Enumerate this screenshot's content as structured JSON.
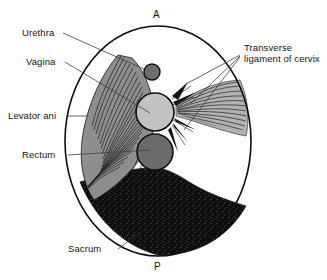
{
  "figure": {
    "orientation": {
      "anterior_marker": "A",
      "posterior_marker": "P"
    },
    "colors": {
      "outline": "#111111",
      "urethra_fill": "#6e6e6e",
      "vagina_fill": "#bdbdbd",
      "rectum_fill": "#6b6b6b",
      "levator_ani_fill": "#8d8d8d",
      "levator_ani_stripe": "#1f1f1f",
      "ligament_stripe": "#2a2a2a",
      "sacrum_fill": "#0d0d0d",
      "leader_line": "#3a3a3a",
      "background": "#ffffff"
    },
    "labels": [
      {
        "id": "urethra",
        "text": "Urethra"
      },
      {
        "id": "vagina",
        "text": "Vagina"
      },
      {
        "id": "levator-ani",
        "text": "Levator ani"
      },
      {
        "id": "rectum",
        "text": "Rectum"
      },
      {
        "id": "sacrum",
        "text": "Sacrum"
      },
      {
        "id": "transverse-ligament",
        "line1": "Transverse",
        "line2": "ligament of cervix"
      }
    ],
    "structures": [
      {
        "id": "urethra",
        "shape": "circle",
        "cx": 152,
        "cy": 72,
        "r": 8
      },
      {
        "id": "vagina",
        "shape": "circle",
        "cx": 155,
        "cy": 112,
        "r": 19
      },
      {
        "id": "rectum",
        "shape": "circle",
        "cx": 155,
        "cy": 152,
        "r": 18
      },
      {
        "id": "levator-ani",
        "shape": "striated-fan"
      },
      {
        "id": "transverse-ligament-of-cervix",
        "shape": "striated-fan"
      },
      {
        "id": "sacrum",
        "shape": "stippled-crescent"
      },
      {
        "id": "pelvic-outline",
        "shape": "ellipse",
        "cx": 158,
        "cy": 141,
        "rx": 93,
        "ry": 115
      }
    ]
  }
}
